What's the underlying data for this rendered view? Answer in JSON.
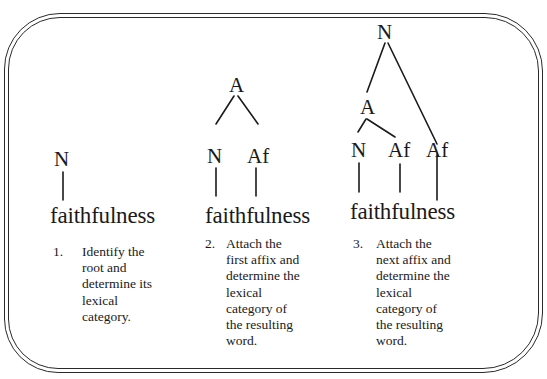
{
  "figure": {
    "frame": "double-rounded-border",
    "panels": [
      {
        "word": "faithfulness",
        "tree": {
          "root": "N",
          "children": []
        },
        "labels": {
          "root": "N"
        },
        "step_number": "1.",
        "step_text": "Identify the\nroot and\ndetermine its\nlexical\ncategory."
      },
      {
        "word": "faithfulness",
        "tree": {
          "root": "A",
          "children": [
            "N",
            "Af"
          ]
        },
        "labels": {
          "root": "A",
          "left": "N",
          "right": "Af"
        },
        "step_number": "2.",
        "step_text": "Attach the\nfirst affix and\ndetermine the\nlexical\ncategory of\nthe resulting\nword."
      },
      {
        "word": "faithfulness",
        "tree": {
          "root": "N",
          "children": [
            {
              "root": "A",
              "children": [
                "N",
                "Af"
              ]
            },
            "Af"
          ]
        },
        "labels": {
          "root": "N",
          "mid": "A",
          "left": "N",
          "middle": "Af",
          "right": "Af"
        },
        "step_number": "3.",
        "step_text": "Attach the\nnext affix and\ndetermine the\nlexical\ncategory of\nthe resulting\nword."
      }
    ]
  }
}
